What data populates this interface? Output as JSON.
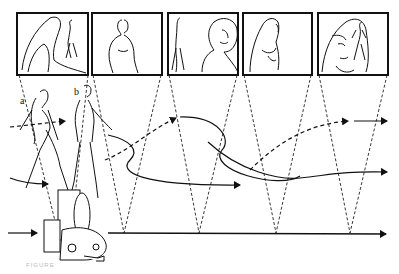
{
  "figure": {
    "type": "line illustration",
    "background": "#ffffff",
    "ink": "#111111"
  },
  "labels": {
    "figure_a": "a",
    "figure_b": "b"
  },
  "frames": [
    {
      "id": 1,
      "content": "woman with long hair in foreground, walking man in distance",
      "x": 17,
      "y": 13,
      "w": 71,
      "h": 62
    },
    {
      "id": 2,
      "content": "man walking, mid shot",
      "x": 92,
      "y": 13,
      "w": 70,
      "h": 62
    },
    {
      "id": 3,
      "content": "distant woman walking, man profile close-up",
      "x": 168,
      "y": 13,
      "w": 70,
      "h": 62
    },
    {
      "id": 4,
      "content": "woman with long hair, mid shot",
      "x": 243,
      "y": 13,
      "w": 69,
      "h": 62
    },
    {
      "id": 5,
      "content": "woman face close-up, distant walking man",
      "x": 318,
      "y": 13,
      "w": 70,
      "h": 62
    }
  ],
  "sight_lines": {
    "style": "dashed",
    "apex_y": 233,
    "apex_x": [
      124,
      199,
      276,
      350
    ]
  },
  "paths": [
    {
      "name": "figure-a-path",
      "style": "dashed-then-solid"
    },
    {
      "name": "figure-b-path",
      "style": "solid-then-dashed"
    },
    {
      "name": "camera-track",
      "style": "solid baseline arrow"
    }
  ],
  "caption": "FIGURE"
}
